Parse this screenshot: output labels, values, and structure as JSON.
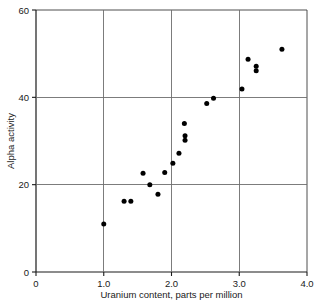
{
  "chart_data": {
    "type": "scatter",
    "title": "",
    "xlabel": "Uranium content, parts per million",
    "ylabel": "Alpha activity",
    "xlim": [
      0,
      4.0
    ],
    "ylim": [
      0,
      60
    ],
    "xticks": [
      0,
      1.0,
      2.0,
      3.0,
      4.0
    ],
    "xtick_labels": [
      "0",
      "1.0",
      "2.0",
      "3.0",
      "4.0"
    ],
    "yticks": [
      0,
      20,
      40,
      60
    ],
    "ytick_labels": [
      "0",
      "20",
      "40",
      "60"
    ],
    "grid": true,
    "grid_lines_x": [
      1.0,
      2.0,
      3.0
    ],
    "grid_lines_y": [
      20,
      40
    ],
    "legend": null,
    "marker": "filled-circle",
    "marker_color": "#000000",
    "points": [
      {
        "x": 1.0,
        "y": 11.0
      },
      {
        "x": 1.3,
        "y": 16.2
      },
      {
        "x": 1.4,
        "y": 16.2
      },
      {
        "x": 1.58,
        "y": 22.6
      },
      {
        "x": 1.68,
        "y": 20.0
      },
      {
        "x": 1.8,
        "y": 17.8
      },
      {
        "x": 1.9,
        "y": 22.8
      },
      {
        "x": 2.02,
        "y": 24.9
      },
      {
        "x": 2.11,
        "y": 27.2
      },
      {
        "x": 2.19,
        "y": 34.0
      },
      {
        "x": 2.2,
        "y": 31.2
      },
      {
        "x": 2.2,
        "y": 30.2
      },
      {
        "x": 2.52,
        "y": 38.6
      },
      {
        "x": 2.62,
        "y": 39.8
      },
      {
        "x": 3.04,
        "y": 41.9
      },
      {
        "x": 3.13,
        "y": 48.7
      },
      {
        "x": 3.25,
        "y": 47.1
      },
      {
        "x": 3.25,
        "y": 46.1
      },
      {
        "x": 3.63,
        "y": 51.0
      }
    ]
  }
}
